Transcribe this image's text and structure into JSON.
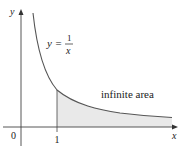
{
  "figure": {
    "function_label": {
      "lhs": "y =",
      "numerator": "1",
      "denominator": "x"
    },
    "region_label": "infinite area",
    "axis_labels": {
      "x": "x",
      "y": "y"
    },
    "tick_labels": {
      "origin": "0",
      "one": "1"
    },
    "colors": {
      "curve": "#555555",
      "axes": "#333333",
      "shade": "#e8e8e8"
    }
  }
}
